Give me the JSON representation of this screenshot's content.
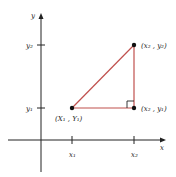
{
  "diagram": {
    "axes": {
      "x_label": "x",
      "y_label": "y"
    },
    "ticks": {
      "x": [
        {
          "label": "x₁",
          "pos": 72
        },
        {
          "label": "x₂",
          "pos": 134
        }
      ],
      "y": [
        {
          "label": "y₂",
          "pos": 45
        },
        {
          "label": "y₁",
          "pos": 108
        }
      ]
    },
    "points": [
      {
        "id": "p1",
        "label": "(X₁ , Y₁)",
        "x": 72,
        "y": 108
      },
      {
        "id": "p2",
        "label": "(x₂ , y₂)",
        "x": 134,
        "y": 45
      },
      {
        "id": "p3",
        "label": "(x₂ , y₁)",
        "x": 134,
        "y": 108
      }
    ],
    "triangle_color": "#c0504d",
    "axis_color": "#222222",
    "right_angle_marker": true
  }
}
